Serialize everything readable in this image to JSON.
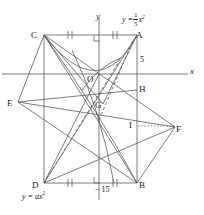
{
  "figure": {
    "type": "geometry-diagram",
    "background": "#ffffff",
    "stroke_color": "#4a4a4a",
    "label_color": "#1a1a1a"
  },
  "axes": {
    "x_label": "x",
    "y_label": "y",
    "origin_label": "O",
    "x_axis_y_px": 74,
    "y_axis_x_px": 99
  },
  "equations": {
    "upper_parabola": {
      "prefix": "y =",
      "numerator": "1",
      "denominator": "5",
      "variable": "x",
      "exponent": "2",
      "plain": "y = 1/5 x^2"
    },
    "lower_parabola": {
      "text": "y = ax",
      "exponent": "2",
      "plain": "y = ax^2"
    }
  },
  "measurements": [
    {
      "name": "segment-5",
      "text": "5"
    },
    {
      "name": "segment-minus-15",
      "text": "− 15"
    }
  ],
  "points": [
    {
      "id": "A",
      "label": "A",
      "x": 137,
      "y": 35
    },
    {
      "id": "C",
      "label": "C",
      "x": 44,
      "y": 35
    },
    {
      "id": "B",
      "label": "B",
      "x": 137,
      "y": 183
    },
    {
      "id": "D",
      "label": "D",
      "x": 44,
      "y": 183
    },
    {
      "id": "E",
      "label": "E",
      "x": 18,
      "y": 102
    },
    {
      "id": "F",
      "label": "F",
      "x": 175,
      "y": 127
    },
    {
      "id": "G",
      "label": "G",
      "x": 103,
      "y": 104
    },
    {
      "id": "H",
      "label": "H",
      "x": 137,
      "y": 90
    },
    {
      "id": "I",
      "label": "I",
      "x": 137,
      "y": 127
    },
    {
      "id": "O",
      "label": "O",
      "x": 99,
      "y": 74
    }
  ],
  "label_positions": {
    "A": {
      "left": 136,
      "top": 30
    },
    "C": {
      "left": 31,
      "top": 30
    },
    "B": {
      "left": 139,
      "top": 181
    },
    "D": {
      "left": 32,
      "top": 181
    },
    "E": {
      "left": 8,
      "top": 99
    },
    "F": {
      "left": 176,
      "top": 124
    },
    "G": {
      "left": 96,
      "top": 101
    },
    "H": {
      "left": 139,
      "top": 84
    },
    "I": {
      "left": 129,
      "top": 121
    },
    "O": {
      "left": 88,
      "top": 74
    },
    "x_axis": {
      "left": 190,
      "top": 68
    },
    "y_axis": {
      "left": 96,
      "top": 12
    },
    "eq_upper": {
      "left": 124,
      "top": 14
    },
    "eq_lower": {
      "left": 24,
      "top": 191
    },
    "num_5": {
      "left": 140,
      "top": 56
    },
    "num_minus15": {
      "left": 96,
      "top": 186
    }
  },
  "marks": {
    "tick_marks": "double hash marks on CA halves and DB halves",
    "right_angle_marks": [
      "at y-axis on CA",
      "at y-axis on DB"
    ],
    "dotted_lines": [
      "C to B (dashed)",
      "D to A (dashed)",
      "I to F (dotted)"
    ]
  }
}
